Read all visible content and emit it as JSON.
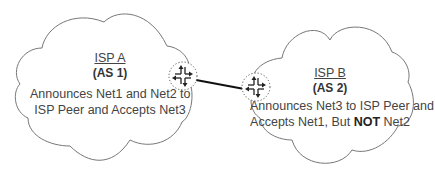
{
  "diagram": {
    "isp_a": {
      "title": "ISP A",
      "as": "(AS 1)",
      "line1": "Announces Net1 and Net2 to",
      "line2": "ISP Peer and Accepts Net3"
    },
    "isp_b": {
      "title": "ISP B",
      "as": "(AS 2)",
      "line1": "Announces Net3 to ISP Peer and",
      "line2_pre": "Accepts Net1, But ",
      "line2_bold": "NOT",
      "line2_post": " Net2"
    },
    "link": {
      "type": "peering-link"
    },
    "colors": {
      "outline": "#666666",
      "link": "#111111",
      "text": "#444444"
    }
  }
}
